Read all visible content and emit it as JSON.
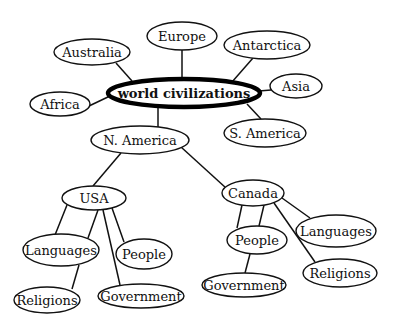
{
  "diagram": {
    "type": "concept-map",
    "center": {
      "id": "world",
      "label": "world civilizations",
      "cx": 184,
      "cy": 93,
      "rx": 76,
      "ry": 14
    },
    "nodes": [
      {
        "id": "australia",
        "label": "Australia",
        "cx": 92,
        "cy": 52,
        "rx": 38,
        "ry": 13
      },
      {
        "id": "europe",
        "label": "Europe",
        "cx": 182,
        "cy": 36,
        "rx": 35,
        "ry": 14
      },
      {
        "id": "antarctica",
        "label": "Antarctica",
        "cx": 267,
        "cy": 45,
        "rx": 43,
        "ry": 14
      },
      {
        "id": "asia",
        "label": "Asia",
        "cx": 296,
        "cy": 86,
        "rx": 26,
        "ry": 12
      },
      {
        "id": "africa",
        "label": "Africa",
        "cx": 60,
        "cy": 104,
        "rx": 30,
        "ry": 12
      },
      {
        "id": "s-america",
        "label": "S. America",
        "cx": 265,
        "cy": 133,
        "rx": 41,
        "ry": 14
      },
      {
        "id": "n-america",
        "label": "N. America",
        "cx": 140,
        "cy": 140,
        "rx": 49,
        "ry": 14
      },
      {
        "id": "usa",
        "label": "USA",
        "cx": 94,
        "cy": 198,
        "rx": 32,
        "ry": 12
      },
      {
        "id": "usa-languages",
        "label": "Languages",
        "cx": 61,
        "cy": 250,
        "rx": 38,
        "ry": 16
      },
      {
        "id": "usa-people",
        "label": "People",
        "cx": 144,
        "cy": 254,
        "rx": 28,
        "ry": 15
      },
      {
        "id": "usa-religions",
        "label": "Religions",
        "cx": 47,
        "cy": 300,
        "rx": 33,
        "ry": 13
      },
      {
        "id": "usa-government",
        "label": "Government",
        "cx": 141,
        "cy": 296,
        "rx": 43,
        "ry": 12
      },
      {
        "id": "canada",
        "label": "Canada",
        "cx": 253,
        "cy": 193,
        "rx": 31,
        "ry": 13
      },
      {
        "id": "canada-people",
        "label": "People",
        "cx": 257,
        "cy": 240,
        "rx": 30,
        "ry": 14
      },
      {
        "id": "canada-languages",
        "label": "Languages",
        "cx": 336,
        "cy": 231,
        "rx": 40,
        "ry": 16
      },
      {
        "id": "canada-religions",
        "label": "Religions",
        "cx": 340,
        "cy": 273,
        "rx": 37,
        "ry": 14
      },
      {
        "id": "canada-government",
        "label": "Government",
        "cx": 244,
        "cy": 285,
        "rx": 42,
        "ry": 12
      }
    ],
    "edges": [
      {
        "from": "world",
        "to": "australia",
        "x1": 132,
        "y1": 81,
        "x2": 116,
        "y2": 63
      },
      {
        "from": "world",
        "to": "europe",
        "x1": 182,
        "y1": 79,
        "x2": 182,
        "y2": 50
      },
      {
        "from": "world",
        "to": "antarctica",
        "x1": 232,
        "y1": 82,
        "x2": 253,
        "y2": 58
      },
      {
        "from": "world",
        "to": "asia",
        "x1": 259,
        "y1": 91,
        "x2": 271,
        "y2": 90
      },
      {
        "from": "world",
        "to": "africa",
        "x1": 110,
        "y1": 96,
        "x2": 89,
        "y2": 106
      },
      {
        "from": "world",
        "to": "s-america",
        "x1": 247,
        "y1": 104,
        "x2": 261,
        "y2": 119
      },
      {
        "from": "world",
        "to": "n-america",
        "x1": 158,
        "y1": 107,
        "x2": 158,
        "y2": 127
      },
      {
        "from": "n-america",
        "to": "usa",
        "x1": 121,
        "y1": 153,
        "x2": 93,
        "y2": 186
      },
      {
        "from": "n-america",
        "to": "canada",
        "x1": 181,
        "y1": 147,
        "x2": 226,
        "y2": 188
      },
      {
        "from": "usa",
        "to": "usa-languages",
        "x1": 67,
        "y1": 205,
        "x2": 55,
        "y2": 235
      },
      {
        "from": "usa",
        "to": "usa-languages",
        "x1": 98,
        "y1": 210,
        "x2": 88,
        "y2": 238
      },
      {
        "from": "usa",
        "to": "usa-government",
        "x1": 103,
        "y1": 210,
        "x2": 120,
        "y2": 285
      },
      {
        "from": "usa",
        "to": "usa-people",
        "x1": 112,
        "y1": 208,
        "x2": 124,
        "y2": 242
      },
      {
        "from": "usa-languages",
        "to": "usa-religions",
        "x1": 79,
        "y1": 265,
        "x2": 72,
        "y2": 289
      },
      {
        "from": "canada",
        "to": "canada-people",
        "x1": 242,
        "y1": 205,
        "x2": 237,
        "y2": 228
      },
      {
        "from": "canada",
        "to": "canada-people",
        "x1": 264,
        "y1": 205,
        "x2": 259,
        "y2": 226
      },
      {
        "from": "canada",
        "to": "canada-religions",
        "x1": 274,
        "y1": 203,
        "x2": 315,
        "y2": 262
      },
      {
        "from": "canada",
        "to": "canada-languages",
        "x1": 282,
        "y1": 198,
        "x2": 310,
        "y2": 218
      },
      {
        "from": "canada-people",
        "to": "canada-government",
        "x1": 250,
        "y1": 254,
        "x2": 245,
        "y2": 273
      }
    ]
  }
}
